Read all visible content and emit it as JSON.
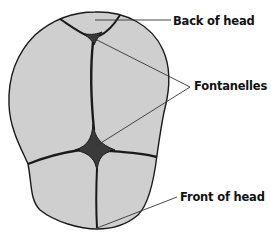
{
  "diagram": {
    "colors": {
      "bone_fill": "#cfcfcf",
      "fontanelle_fill": "#3a3a3a",
      "outline": "#1a1a1a",
      "leader_line": "#333333",
      "label_text": "#111111",
      "background": "#ffffff"
    },
    "labels": {
      "back": "Back of head",
      "fontanelles": "Fontanelles",
      "front": "Front of head"
    },
    "parts": [
      {
        "name": "posterior-fontanelle",
        "description": "Small triangular fontanelle near back of head"
      },
      {
        "name": "anterior-fontanelle",
        "description": "Large diamond-shaped fontanelle near center-front"
      },
      {
        "name": "skull-plates",
        "count": 5
      }
    ]
  }
}
